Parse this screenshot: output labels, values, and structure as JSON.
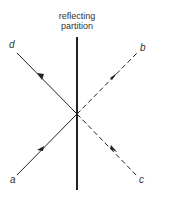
{
  "title_line1": "reflecting",
  "title_line2": "partition",
  "labels": {
    "a": "a",
    "b": "b",
    "c": "c",
    "d": "d"
  },
  "colors": {
    "line": "#222222",
    "text": "#333333"
  },
  "rays": [
    {
      "from": "a",
      "to": "d",
      "style": "solid"
    },
    {
      "from": "c",
      "to": "b",
      "style": "dashed"
    }
  ]
}
